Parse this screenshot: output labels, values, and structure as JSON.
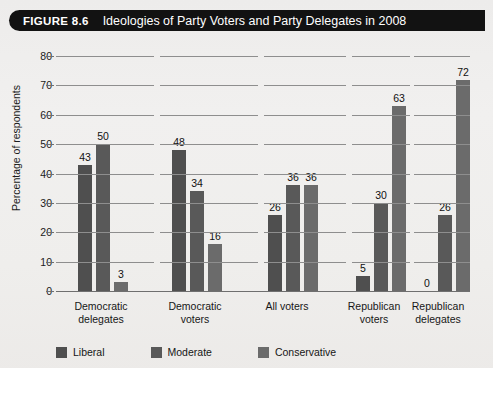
{
  "banner": {
    "figure_number": "FIGURE 8.6",
    "title": "Ideologies of Party Voters and Party Delegates in 2008"
  },
  "colors": {
    "liberal": "#4f4f4f",
    "moderate": "#595959",
    "conservative": "#6b6b6b",
    "banner_bg": "#121212",
    "banner_text": "#ffffff",
    "paper_bg": "#f0efed",
    "grid": "#8e8e8e",
    "axis": "#6f6f6f"
  },
  "chart_data": {
    "type": "bar",
    "title": "Ideologies of Party Voters and Party Delegates in 2008",
    "xlabel": "",
    "ylabel": "Percentage of respondents",
    "ylim": [
      0,
      80
    ],
    "ytick_labels": [
      "0",
      "10",
      "20",
      "30",
      "40",
      "50",
      "60",
      "70",
      "80"
    ],
    "yticks": [
      0,
      10,
      20,
      30,
      40,
      50,
      60,
      70,
      80
    ],
    "grid": true,
    "legend_position": "bottom-left",
    "categories": [
      "Democratic delegates",
      "Democratic voters",
      "All voters",
      "Republican voters",
      "Republican delegates"
    ],
    "category_lines": [
      [
        "Democratic",
        "delegates"
      ],
      [
        "Democratic",
        "voters"
      ],
      [
        "All voters",
        ""
      ],
      [
        "Republican",
        "voters"
      ],
      [
        "Republican",
        "delegates"
      ]
    ],
    "series": [
      {
        "name": "Liberal",
        "values": [
          43,
          48,
          26,
          5,
          0
        ]
      },
      {
        "name": "Moderate",
        "values": [
          50,
          34,
          36,
          30,
          26
        ]
      },
      {
        "name": "Conservative",
        "values": [
          3,
          16,
          36,
          63,
          72
        ]
      }
    ],
    "value_labels": [
      [
        "43",
        "50",
        "3"
      ],
      [
        "48",
        "34",
        "16"
      ],
      [
        "26",
        "36",
        "36"
      ],
      [
        "5",
        "30",
        "63"
      ],
      [
        "0",
        "26",
        "72"
      ]
    ]
  },
  "legend": {
    "items": [
      {
        "label": "Liberal"
      },
      {
        "label": "Moderate"
      },
      {
        "label": "Conservative"
      }
    ]
  }
}
